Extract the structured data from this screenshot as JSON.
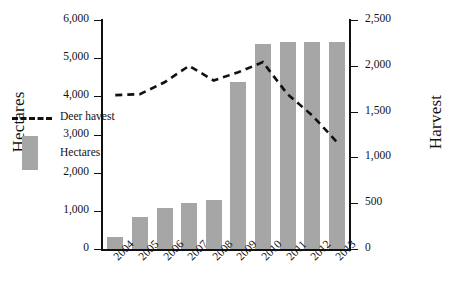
{
  "chart_data": {
    "type": "bar",
    "title": "",
    "categories": [
      "2004",
      "2005",
      "2006",
      "2007",
      "2008",
      "2009",
      "2010",
      "2011",
      "2012",
      "2013"
    ],
    "xlabel": "",
    "grid": false,
    "legend_position": "inside-left",
    "series": [
      {
        "name": "Hectares",
        "type": "bar",
        "axis": "left",
        "color": "#a6a6a6",
        "values": [
          320,
          840,
          1080,
          1210,
          1290,
          4380,
          5370,
          5430,
          5430,
          5430
        ]
      },
      {
        "name": "Deer havest",
        "type": "line",
        "axis": "right",
        "color": "#111111",
        "style": "dashed",
        "values": [
          1680,
          1690,
          1820,
          2000,
          1840,
          1930,
          2040,
          1690,
          1460,
          1170
        ]
      }
    ],
    "axes": {
      "left": {
        "label": "Hectares",
        "min": 0,
        "max": 6000,
        "ticks": [
          0,
          1000,
          2000,
          3000,
          4000,
          5000,
          6000
        ],
        "tick_labels": [
          "0",
          "1,000",
          "2,000",
          "3,000",
          "4,000",
          "5,000",
          "6,000"
        ]
      },
      "right": {
        "label": "Harvest",
        "min": 0,
        "max": 2500,
        "ticks": [
          0,
          500,
          1000,
          1500,
          2000,
          2500
        ],
        "tick_labels": [
          "0",
          "500",
          "1,000",
          "1,500",
          "2,000",
          "2,500"
        ]
      }
    },
    "legend": [
      {
        "label": "Deer havest",
        "marker": "dashed-line"
      },
      {
        "label": "Hectares",
        "marker": "filled-rect"
      }
    ]
  }
}
